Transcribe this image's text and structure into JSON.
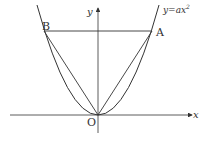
{
  "figure": {
    "type": "parabola-diagram",
    "curve_label": "y=ax²",
    "curve_label_parts": {
      "prefix": "y=",
      "var": "ax",
      "exp": "2"
    },
    "axes": {
      "x_label": "x",
      "y_label": "y",
      "origin_label": "O"
    },
    "points": [
      {
        "name": "A",
        "label": "A",
        "px": 152,
        "py": 31
      },
      {
        "name": "B",
        "label": "B",
        "px": 44,
        "py": 31
      },
      {
        "name": "O",
        "label": "O",
        "px": 98,
        "py": 115
      }
    ],
    "segments": [
      "AB",
      "OA",
      "OB"
    ],
    "colors": {
      "stroke": "#333333",
      "background": "#ffffff"
    }
  }
}
